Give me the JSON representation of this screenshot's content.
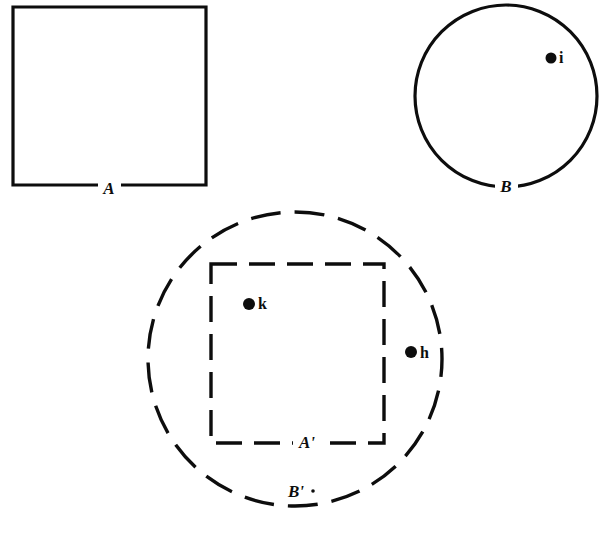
{
  "figure": {
    "background_color": "#ffffff",
    "ink_color": "#0d0d0d",
    "width": 605,
    "height": 533,
    "shapes": [
      {
        "id": "square-A",
        "kind": "square",
        "label": "A",
        "stroke_style": "solid",
        "x": 13,
        "y": 7,
        "width": 193,
        "height": 178,
        "label_x": 109,
        "label_y": 190
      },
      {
        "id": "circle-B",
        "kind": "circle",
        "label": "B",
        "stroke_style": "solid",
        "cx": 506,
        "cy": 96,
        "r": 91,
        "label_x": 506,
        "label_y": 188
      },
      {
        "id": "circle-B-prime",
        "kind": "circle",
        "label": "B'",
        "stroke_style": "dashed",
        "cx": 295,
        "cy": 359,
        "r": 147,
        "label_x": 296,
        "label_y": 493
      },
      {
        "id": "square-A-prime",
        "kind": "square",
        "label": "A'",
        "stroke_style": "dashed",
        "x": 211,
        "y": 264,
        "width": 173,
        "height": 179,
        "label_x": 307,
        "label_y": 444
      }
    ],
    "points": [
      {
        "id": "point-i",
        "label": "i",
        "cx": 551,
        "cy": 58,
        "r": 5.5,
        "label_x": 559,
        "label_y": 59,
        "inside": "circle-B"
      },
      {
        "id": "point-k",
        "label": "k",
        "cx": 249,
        "cy": 304,
        "r": 6,
        "label_x": 258,
        "label_y": 305,
        "inside": "square-A-prime"
      },
      {
        "id": "point-h",
        "label": "h",
        "cx": 411,
        "cy": 352,
        "r": 6,
        "label_x": 420,
        "label_y": 354,
        "inside": "circle-B-prime"
      }
    ]
  }
}
